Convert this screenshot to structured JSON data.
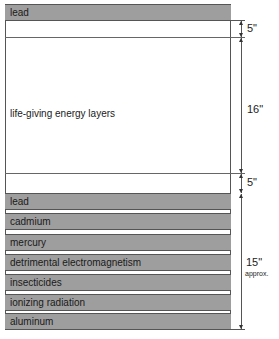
{
  "diagram": {
    "top_layer": {
      "label": "lead"
    },
    "middle_layer": {
      "label": "life-giving energy layers"
    },
    "bottom_layers": [
      {
        "label": "lead"
      },
      {
        "label": "cadmium"
      },
      {
        "label": "mercury"
      },
      {
        "label": "detrimental electromagnetism"
      },
      {
        "label": "insecticides"
      },
      {
        "label": "ionizing radiation"
      },
      {
        "label": "aluminum"
      }
    ],
    "dimensions": [
      {
        "label": "5\""
      },
      {
        "label": "16\""
      },
      {
        "label": "5\""
      },
      {
        "label": "15\"",
        "note": "approx."
      }
    ],
    "colors": {
      "bar_fill": "#9e9e9e",
      "outline": "#555555",
      "background": "#ffffff"
    }
  }
}
